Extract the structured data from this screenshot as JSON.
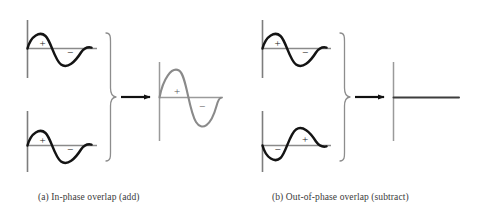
{
  "figure": {
    "background_color": "#ffffff",
    "wave_color": "#141414",
    "axis_color": "#7d7d7d",
    "result_color": "#8a8a8a",
    "brace_color": "#8d8d8d",
    "arrow_color": "#111111",
    "caption_color": "#3a3a3a"
  },
  "panels": [
    {
      "id": "a",
      "caption": "(a)  In-phase overlap (add)",
      "operation": "add",
      "inputs": [
        {
          "name": "top-wave",
          "phase": "in-phase",
          "lobes": [
            {
              "sign": "+",
              "position": "first",
              "direction": "up"
            },
            {
              "sign": "−",
              "position": "second",
              "direction": "down"
            }
          ]
        },
        {
          "name": "bottom-wave",
          "phase": "in-phase",
          "lobes": [
            {
              "sign": "+",
              "position": "first",
              "direction": "up"
            },
            {
              "sign": "−",
              "position": "second",
              "direction": "down"
            }
          ]
        }
      ],
      "result": {
        "name": "constructive-wave",
        "type": "wave",
        "description": "larger amplitude wave",
        "lobes": [
          {
            "sign": "+",
            "position": "first",
            "direction": "up"
          },
          {
            "sign": "−",
            "position": "second",
            "direction": "down"
          }
        ]
      }
    },
    {
      "id": "b",
      "caption": "(b)  Out-of-phase overlap (subtract)",
      "operation": "subtract",
      "inputs": [
        {
          "name": "top-wave",
          "phase": "in-phase",
          "lobes": [
            {
              "sign": "+",
              "position": "first",
              "direction": "up"
            },
            {
              "sign": "−",
              "position": "second",
              "direction": "down"
            }
          ]
        },
        {
          "name": "bottom-wave",
          "phase": "out-of-phase",
          "lobes": [
            {
              "sign": "−",
              "position": "first",
              "direction": "down"
            },
            {
              "sign": "+",
              "position": "second",
              "direction": "up"
            }
          ]
        }
      ],
      "result": {
        "name": "node-line",
        "type": "flat-line",
        "description": "flat line - waves cancel",
        "lobes": []
      }
    }
  ],
  "signs": {
    "plus": "+",
    "minus": "−"
  }
}
